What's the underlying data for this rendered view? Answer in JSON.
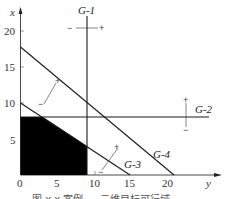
{
  "figure": {
    "caption": "图 x.x  案例 — 二维目标可行域",
    "axes": {
      "horizontal_label": "y",
      "vertical_label": "x",
      "horizontal_ticks": [
        "0",
        "5",
        "10",
        "15",
        "20"
      ],
      "vertical_ticks": [
        "5",
        "10",
        "15",
        "20"
      ]
    },
    "goals": [
      {
        "id": "G-1",
        "label": "G-1",
        "equation": "y = 9",
        "orientation": "vertical",
        "plus_side": "+",
        "minus_side": "−"
      },
      {
        "id": "G-2",
        "label": "G-2",
        "equation": "x = 8",
        "orientation": "horizontal",
        "plus_side": "+",
        "minus_side": "−"
      },
      {
        "id": "G-3",
        "label": "G-3",
        "equation": "x + 0.667y = 10",
        "plus_side": "+",
        "minus_side": "−"
      },
      {
        "id": "G-4",
        "label": "G-4",
        "equation": "x + 0.667y = 14",
        "plus_side": "+",
        "minus_side": "−"
      }
    ],
    "feasible_region": {
      "description": "Shaded region bounded by axes, G-1, G-2 and G-3",
      "vertices": [
        [
          0,
          0
        ],
        [
          0,
          8
        ],
        [
          3,
          8
        ],
        [
          9,
          4
        ],
        [
          9,
          0
        ]
      ],
      "color": "#000000"
    },
    "colors": {
      "line": "#1a1a1a",
      "axis": "#333333",
      "fill": "#000000"
    }
  }
}
